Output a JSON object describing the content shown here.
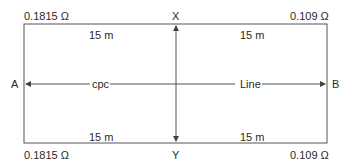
{
  "diagram": {
    "corners": {
      "top_left_resistance": "0.1815 Ω",
      "top_right_resistance": "0.109 Ω",
      "bottom_left_resistance": "0.1815 Ω",
      "bottom_right_resistance": "0.109 Ω"
    },
    "points": {
      "left": "A",
      "right": "B",
      "top": "X",
      "bottom": "Y"
    },
    "lengths": {
      "top_left": "15 m",
      "top_right": "15 m",
      "bottom_left": "15 m",
      "bottom_right": "15 m"
    },
    "conductors": {
      "left_label": "cpc",
      "right_label": "Line"
    },
    "colors": {
      "line": "#555555",
      "text": "#2a2a2a"
    }
  }
}
